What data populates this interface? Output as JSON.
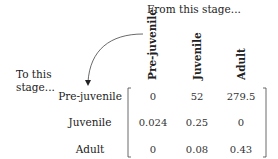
{
  "labels": {
    "from_stage": "From this stage...",
    "to_stage_line1": "To this",
    "to_stage_line2": "stage..."
  },
  "columns": [
    "Pre-juvenile",
    "Juvenile",
    "Adult"
  ],
  "rows": [
    {
      "label": "Pre-juvenile",
      "values": [
        "0",
        "52",
        "279.5"
      ]
    },
    {
      "label": "Juvenile",
      "values": [
        "0.024",
        "0.25",
        "0"
      ]
    },
    {
      "label": "Adult",
      "values": [
        "0",
        "0.08",
        "0.43"
      ]
    }
  ]
}
